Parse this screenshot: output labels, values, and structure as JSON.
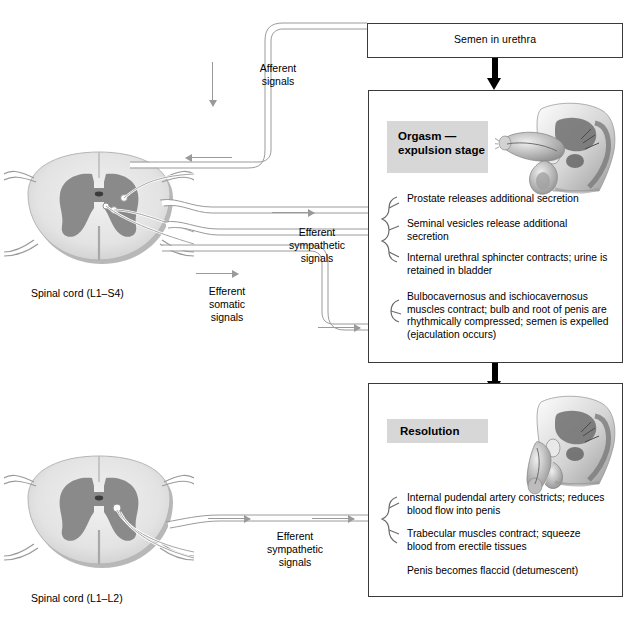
{
  "boxes": {
    "semen": {
      "label": "Semen in urethra"
    },
    "orgasm": {
      "stage_label": "Orgasm —\nexpulsion\nstage",
      "items": [
        "Prostate releases additional secretion",
        "Seminal vesicles release additional\nsecretion",
        "Internal urethral sphincter contracts; urine is\nretained in bladder",
        "Bulbocavernosus and ischiocavernosus\nmuscles contract; bulb and root of penis are\nrhythmically compressed; semen is expelled\n(ejaculation occurs)"
      ]
    },
    "resolution": {
      "stage_label": "Resolution",
      "items": [
        "Internal pudendal artery constricts; reduces\nblood flow into penis",
        "Trabecular muscles contract; squeeze\nblood from erectile tissues",
        "Penis becomes flaccid (detumescent)"
      ]
    }
  },
  "signals": {
    "afferent": "Afferent\nsignals",
    "efferent_sympathetic_top": "Efferent\nsympathetic\nsignals",
    "efferent_somatic": "Efferent\nsomatic\nsignals",
    "efferent_sympathetic_bottom": "Efferent\nsympathetic\nsignals"
  },
  "spinal_cords": {
    "upper_caption": "Spinal cord (L1–S4)",
    "lower_caption": "Spinal cord (L1–L2)"
  },
  "icons": {
    "thick_down_arrow": "thick-down-arrow-icon",
    "gray_flow_arrow": "gray-flow-arrow-icon",
    "brace": "curly-brace-icon",
    "spinal_cord_illustration": "spinal-cord-cross-section-icon",
    "male_anatomy_illustration": "male-pelvis-sagittal-section-icon"
  },
  "colors": {
    "box_border": "#3a3a3a",
    "stage_tag_bg": "#d7d7d7",
    "nerve_line": "#9a9a9a",
    "gray_matter": "#8a8a8a",
    "white_matter": "#e2e2e2",
    "background": "#ffffff"
  }
}
